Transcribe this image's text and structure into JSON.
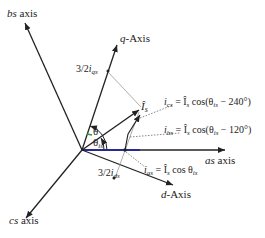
{
  "axes": {
    "as": {
      "label_italic": "as",
      "label_rest": " axis"
    },
    "bs": {
      "label_italic": "bs",
      "label_rest": " axis"
    },
    "cs": {
      "label_italic": "cs",
      "label_rest": " axis"
    },
    "q": {
      "label_italic": "q",
      "label_rest": "-Axis"
    },
    "d": {
      "label_italic": "d",
      "label_rest": "-Axis"
    }
  },
  "vector": {
    "label": "Î",
    "sub": "s"
  },
  "angles": {
    "theta": "θ",
    "theta_is": {
      "main": "θ",
      "sub": "is"
    }
  },
  "projections": {
    "qs": {
      "prefix": "3/2",
      "var": "i",
      "sub": "qs"
    },
    "ds": {
      "prefix": "3/2",
      "var": "i",
      "sub": "ds"
    }
  },
  "equations": {
    "ics": {
      "lhs_var": "i",
      "lhs_sub": "cs",
      "rhs": " = Î",
      "rhs_sub": "s",
      "tail": " cos(θ",
      "tail_sub": "is",
      "end": " − 240°)"
    },
    "ibs": {
      "lhs_var": "i",
      "lhs_sub": "bs",
      "rhs": " = Î",
      "rhs_sub": "s",
      "tail": " cos(θ",
      "tail_sub": "is",
      "end": " − 120°)"
    },
    "ias": {
      "lhs_var": "i",
      "lhs_sub": "as",
      "rhs": " = Î",
      "rhs_sub": "s",
      "tail": " cos θ",
      "tail_sub": "is",
      "end": ""
    }
  },
  "colors": {
    "line": "#222222",
    "as_axis": "#1a1aa8",
    "theta_marker": "#2a9d2a",
    "guide": "#999999"
  }
}
